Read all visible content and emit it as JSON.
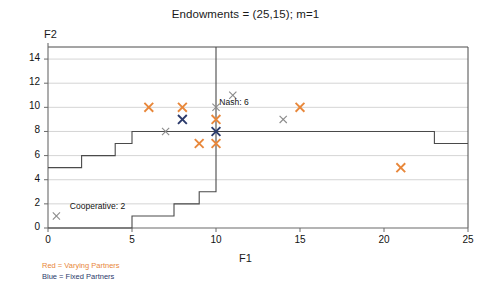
{
  "chart_data": {
    "type": "scatter",
    "title": "Endowments = (25,15); m=1",
    "xlabel": "F1",
    "ylabel": "F2",
    "xlim": [
      0,
      25
    ],
    "ylim": [
      0,
      15
    ],
    "xticks": [
      0,
      5,
      10,
      15,
      20,
      25
    ],
    "yticks": [
      0,
      2,
      4,
      6,
      8,
      10,
      12,
      14
    ],
    "grid": true,
    "legend_position": "below-left",
    "legend": [
      {
        "label": "Red = Varying Partners",
        "color": "#E8873A"
      },
      {
        "label": "Blue = Fixed Partners",
        "color": "#2b3a6b"
      }
    ],
    "annotations": [
      {
        "text": "Nash: 6",
        "x": 10.2,
        "y": 10.4
      },
      {
        "text": "Cooperative: 2",
        "x": 1.3,
        "y": 1.75
      }
    ],
    "series": [
      {
        "name": "Varying Partners",
        "color": "#E8873A",
        "marker": "x",
        "points": [
          {
            "x": 6,
            "y": 10
          },
          {
            "x": 8,
            "y": 10
          },
          {
            "x": 10,
            "y": 9
          },
          {
            "x": 10,
            "y": 7
          },
          {
            "x": 9,
            "y": 7
          },
          {
            "x": 15,
            "y": 10
          },
          {
            "x": 21,
            "y": 5
          }
        ]
      },
      {
        "name": "Fixed Partners",
        "color": "#2b3a6b",
        "marker": "x",
        "points": [
          {
            "x": 8,
            "y": 9
          },
          {
            "x": 10,
            "y": 8
          }
        ]
      },
      {
        "name": "Reference",
        "color": "#8a8a8a",
        "marker": "x",
        "points": [
          {
            "x": 0.5,
            "y": 1
          },
          {
            "x": 7,
            "y": 8
          },
          {
            "x": 10,
            "y": 10
          },
          {
            "x": 11,
            "y": 11
          },
          {
            "x": 14,
            "y": 9
          }
        ]
      }
    ],
    "step_lines": [
      {
        "name": "upper-frontier",
        "color": "#4a4a4a",
        "vertices": [
          {
            "x": 0,
            "y": 5
          },
          {
            "x": 2,
            "y": 5
          },
          {
            "x": 2,
            "y": 6
          },
          {
            "x": 4,
            "y": 6
          },
          {
            "x": 4,
            "y": 7
          },
          {
            "x": 5,
            "y": 7
          },
          {
            "x": 5,
            "y": 8
          },
          {
            "x": 23,
            "y": 8
          },
          {
            "x": 23,
            "y": 7
          },
          {
            "x": 25,
            "y": 7
          }
        ]
      },
      {
        "name": "lower-frontier",
        "color": "#4a4a4a",
        "vertices": [
          {
            "x": 0,
            "y": 0
          },
          {
            "x": 5,
            "y": 0
          },
          {
            "x": 5,
            "y": 1
          },
          {
            "x": 7.5,
            "y": 1
          },
          {
            "x": 7.5,
            "y": 2
          },
          {
            "x": 9,
            "y": 2
          },
          {
            "x": 9,
            "y": 3
          },
          {
            "x": 10,
            "y": 3
          },
          {
            "x": 10,
            "y": 15
          }
        ]
      }
    ]
  }
}
